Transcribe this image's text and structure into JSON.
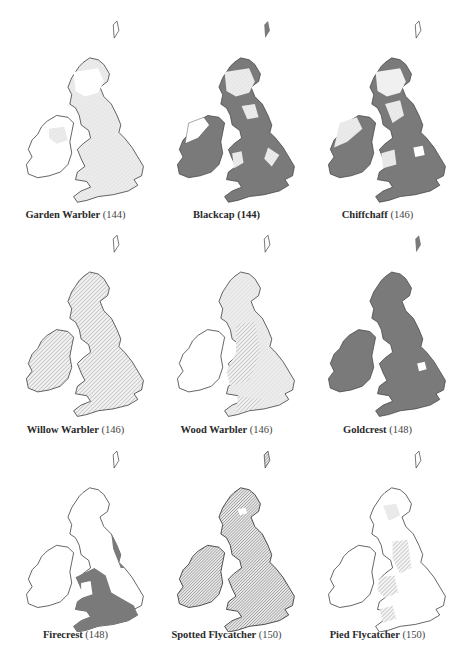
{
  "figure": {
    "type": "species distribution maps, Britain and Ireland",
    "legend_fills": {
      "dark": "#7a7a7a",
      "hatched": "#9a9a9a",
      "stipple": "#d6d6d6",
      "outline": "#333333",
      "background": "#ffffff"
    }
  },
  "panels": [
    {
      "name": "Garden Warbler",
      "page": "(144)",
      "page_bold": false,
      "fill": "stipple"
    },
    {
      "name": "Blackcap",
      "page": "(144)",
      "page_bold": true,
      "fill": "dark-with-light-north"
    },
    {
      "name": "Chiffchaff",
      "page": "(146)",
      "page_bold": false,
      "fill": "dark-with-light-patches"
    },
    {
      "name": "Willow Warbler",
      "page": "(146)",
      "page_bold": false,
      "fill": "hatched-all"
    },
    {
      "name": "Wood Warbler",
      "page": "(146)",
      "page_bold": false,
      "fill": "hatched-west-stipple"
    },
    {
      "name": "Goldcrest",
      "page": "(148)",
      "page_bold": false,
      "fill": "dark-all"
    },
    {
      "name": "Firecrest",
      "page": "(148)",
      "page_bold": false,
      "fill": "dark-south-only"
    },
    {
      "name": "Spotted Flycatcher",
      "page": "(150)",
      "page_bold": false,
      "fill": "dense-hatched-all"
    },
    {
      "name": "Pied Flycatcher",
      "page": "(150)",
      "page_bold": false,
      "fill": "hatched-west-patches"
    }
  ]
}
